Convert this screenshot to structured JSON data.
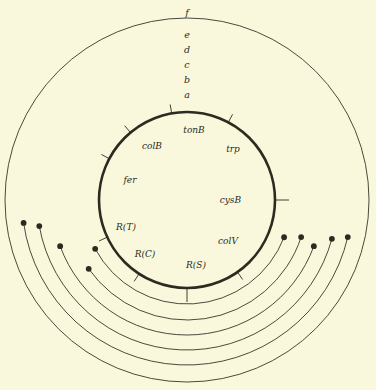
{
  "figure": {
    "background_color": "#f9f8dc",
    "ink_color": "#2b2b20",
    "center": {
      "x": 187,
      "y": 200
    },
    "inner_circle": {
      "label": "inner-chromosome-circle",
      "radius": 88,
      "stroke_width": 2.6
    }
  },
  "chart_data": {
    "type": "diagram",
    "title": "",
    "subtitle": "",
    "grid": false,
    "legend": "none",
    "arcs": [
      {
        "id": "a",
        "label": "a",
        "radius": 104,
        "label_x": 187,
        "label_y": 98,
        "start_angle_deg": 208,
        "end_angle_deg": 339,
        "start_point": {
          "x": 153,
          "y": 105
        },
        "end_point": {
          "x": 219,
          "y": 104
        },
        "endpoint_style": "filled-dot"
      },
      {
        "id": "b",
        "label": "b",
        "radius": 120,
        "label_x": 187,
        "label_y": 83,
        "start_angle_deg": 215,
        "end_angle_deg": 342,
        "start_point": {
          "x": 105,
          "y": 116
        },
        "end_point": {
          "x": 226,
          "y": 90
        },
        "endpoint_style": "filled-dot"
      },
      {
        "id": "c",
        "label": "c",
        "radius": 135,
        "label_x": 187,
        "label_y": 68,
        "start_angle_deg": 200,
        "end_angle_deg": 340,
        "start_point": {
          "x": 140,
          "y": 62
        },
        "end_point": {
          "x": 232,
          "y": 78
        },
        "endpoint_style": "filled-dot"
      },
      {
        "id": "d",
        "label": "d",
        "radius": 150,
        "label_x": 187,
        "label_y": 53,
        "start_angle_deg": 190,
        "end_angle_deg": 345,
        "start_point": {
          "x": 58,
          "y": 214
        },
        "end_point": {
          "x": 330,
          "y": 243
        },
        "endpoint_style": "filled-dot"
      },
      {
        "id": "e",
        "label": "e",
        "radius": 165,
        "label_x": 187,
        "label_y": 38,
        "start_angle_deg": 188,
        "end_angle_deg": 347,
        "start_point": {
          "x": 28,
          "y": 214
        },
        "end_point": {
          "x": 347,
          "y": 246
        },
        "endpoint_style": "filled-dot"
      },
      {
        "id": "f",
        "label": "f",
        "radius": 182,
        "label_x": 187,
        "label_y": 16,
        "start_angle_deg": 0,
        "end_angle_deg": 360,
        "closed": true,
        "endpoint_style": "none"
      }
    ],
    "genes": [
      {
        "name": "colB",
        "angle_deg": 237,
        "label_x": 152,
        "label_y": 149,
        "tick_len": 9,
        "leader": "diagonal"
      },
      {
        "name": "tonB",
        "angle_deg": 270,
        "label_x": 194,
        "label_y": 133,
        "tick_len": 14,
        "leader": "vertical"
      },
      {
        "name": "trp",
        "angle_deg": 305,
        "label_x": 233,
        "label_y": 152,
        "tick_len": 9,
        "leader": "diagonal"
      },
      {
        "name": "fer",
        "angle_deg": 205,
        "label_x": 130,
        "label_y": 183,
        "tick_len": 9,
        "leader": "diagonal"
      },
      {
        "name": "cysB",
        "angle_deg": 0,
        "label_x": 241,
        "label_y": 203,
        "tick_len": 14,
        "leader": "horizontal"
      },
      {
        "name": "R(T)",
        "angle_deg": 152,
        "label_x": 126,
        "label_y": 230,
        "tick_len": 9,
        "leader": "diagonal"
      },
      {
        "name": "R(C)",
        "angle_deg": 130,
        "label_x": 145,
        "label_y": 257,
        "tick_len": 9,
        "leader": "diagonal"
      },
      {
        "name": "R(S)",
        "angle_deg": 100,
        "label_x": 196,
        "label_y": 268,
        "tick_len": 9,
        "leader": "diagonal"
      },
      {
        "name": "colV",
        "angle_deg": 62,
        "label_x": 228,
        "label_y": 244,
        "tick_len": 9,
        "leader": "diagonal"
      }
    ]
  }
}
